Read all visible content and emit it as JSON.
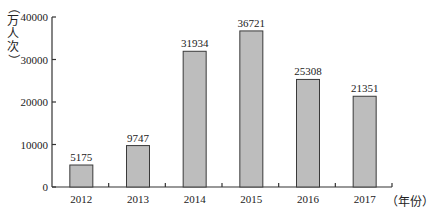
{
  "chart_data": {
    "type": "bar",
    "title": "",
    "xlabel": "（年份）",
    "ylabel": "（万人次）",
    "categories": [
      "2012",
      "2013",
      "2014",
      "2015",
      "2016",
      "2017"
    ],
    "values": [
      5175,
      9747,
      31934,
      36721,
      25308,
      21351
    ],
    "data_labels": [
      "5175",
      "9747",
      "31934",
      "36721",
      "25308",
      "21351"
    ],
    "ylim": [
      0,
      40000
    ],
    "yticks": [
      0,
      10000,
      20000,
      30000,
      40000
    ],
    "ytick_labels": [
      "0",
      "10000",
      "20000",
      "30000",
      "40000"
    ],
    "grid": false,
    "legend": null,
    "colors": {
      "bar_fill": "#bdbdbd",
      "bar_stroke": "#3a3a3a",
      "axis": "#333333",
      "text": "#222222"
    }
  }
}
